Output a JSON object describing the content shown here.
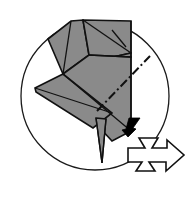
{
  "figure": {
    "kind": "origami-instruction",
    "caption": "",
    "canvas": {
      "width": 188,
      "height": 198
    },
    "background_color": "#ffffff"
  },
  "colors": {
    "paper_fill": "#8a8a8a",
    "paper_edge": "#111111",
    "circle_stroke": "#1a1a1a",
    "circle_fill": "#ffffff",
    "solid_arrow": "#000000",
    "hollow_arrow_fill": "#ffffff",
    "hollow_arrow_stroke": "#111111"
  },
  "frame": {
    "name": "detail-circle",
    "center_x": 95,
    "center_y": 96,
    "radius": 74
  },
  "paper": {
    "label": "folded paper model",
    "facets": [
      {
        "name": "upper-left-panel",
        "points": "48,39 71,21 83,20 89,55 63,74"
      },
      {
        "name": "upper-right-panel",
        "points": "83,20 131,21 131,53 95,61 89,55"
      },
      {
        "name": "upper-right-small-panel",
        "points": "89,55 95,61 131,53 131,57 97,65"
      },
      {
        "name": "main-central-panel",
        "points": "63,74 89,55 131,57 131,131 112,141 87,114"
      },
      {
        "name": "left-wing-panel",
        "points": "35,88 63,74 112,113 93,128 36,92"
      },
      {
        "name": "lower-spike",
        "points": "96,118 106,119 102,163"
      }
    ],
    "creases": [
      {
        "name": "crease-upper-diagonal",
        "d": "M 83,20 L 131,53"
      },
      {
        "name": "crease-upper-short",
        "d": "M 112,30 L 126,47"
      },
      {
        "name": "crease-mid-horizontal",
        "d": "M 89,55 L 131,57"
      },
      {
        "name": "crease-left-vertical",
        "d": "M 71,21 L 63,74"
      },
      {
        "name": "crease-body-diagonal",
        "d": "M 63,74 L 131,131"
      },
      {
        "name": "crease-wing-fold",
        "d": "M 35,88 L 112,113"
      },
      {
        "name": "crease-right-edge",
        "d": "M 131,21 L 131,131"
      },
      {
        "name": "crease-spike-left",
        "d": "M 96,118 L 102,163"
      },
      {
        "name": "crease-spike-right",
        "d": "M 106,119 L 102,163"
      }
    ]
  },
  "annotations": {
    "mountain_fold": {
      "name": "mountain-fold-line",
      "style": "dash-dot",
      "dash_pattern": "9 3 2 3",
      "d": "M 97,111 L 150,56"
    },
    "fold_arrow": {
      "name": "fold-direction-arrow",
      "style": "solid-filled",
      "direction": "down-left",
      "points": "140,118 133,128 136,129 128,137 122,130 126,129 129,118"
    },
    "action_arrow": {
      "name": "turn-over-arrow",
      "style": "hollow-outline",
      "direction": "right",
      "points": "128,148 145,148 139,138 158,138 152,148 167,148 167,140 184,155 166,171 166,162 149,162 155,171 136,171 142,162 128,162"
    }
  }
}
